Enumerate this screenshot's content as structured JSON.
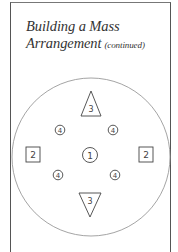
{
  "title": {
    "line1": "Building a Mass",
    "line2": "Arrangement",
    "suffix": "(continued)"
  },
  "diagram": {
    "container": {
      "shape": "circle",
      "cx": 91,
      "cy": 157,
      "r": 79,
      "stroke": "#9a9a9a"
    },
    "elements": [
      {
        "shape": "triangle-up",
        "label": "3",
        "cx": 91,
        "cy": 104
      },
      {
        "shape": "circle-small",
        "label": "4",
        "cx": 60,
        "cy": 130
      },
      {
        "shape": "circle-small",
        "label": "4",
        "cx": 113,
        "cy": 130
      },
      {
        "shape": "square",
        "label": "2",
        "cx": 33,
        "cy": 155
      },
      {
        "shape": "circle-medium",
        "label": "1",
        "cx": 90,
        "cy": 155
      },
      {
        "shape": "square",
        "label": "2",
        "cx": 146,
        "cy": 155
      },
      {
        "shape": "circle-small",
        "label": "4",
        "cx": 58,
        "cy": 175
      },
      {
        "shape": "circle-small",
        "label": "4",
        "cx": 115,
        "cy": 175
      },
      {
        "shape": "triangle-down",
        "label": "3",
        "cx": 90,
        "cy": 204
      }
    ]
  }
}
